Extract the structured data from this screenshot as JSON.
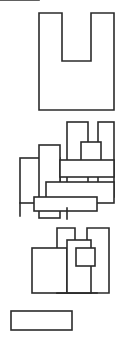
{
  "canvas": {
    "width": 135,
    "height": 339,
    "background_color": "#ffffff",
    "stroke_color": "#2b2b2b",
    "stroke_width": 1.6,
    "description": "Black-and-white line drawing of three grouped figures made of overlapping open rectangles"
  },
  "figures": [
    {
      "id": "top-figure",
      "name": "u-shape-with-base-divider",
      "parts": [
        {
          "name": "u-outline",
          "type": "polygon",
          "points": "39,13 62,13 62,61 91,61 91,13 114,13 114,110 39,110"
        },
        {
          "name": "base-divider-line",
          "type": "line",
          "x1": 39,
          "y1": 81,
          "x2": 114,
          "y2": 81
        }
      ]
    },
    {
      "id": "middle-figure",
      "name": "overlapping-rectangle-cluster",
      "parts": [
        {
          "name": "rect-a-tall-left",
          "type": "rect",
          "x": 39,
          "y": 145,
          "width": 21,
          "height": 73
        },
        {
          "name": "rect-b-low-left",
          "type": "rect",
          "x": 20,
          "y": 158,
          "width": 40,
          "height": 45
        },
        {
          "name": "rect-c-tall-center",
          "type": "rect",
          "x": 67,
          "y": 122,
          "width": 21,
          "height": 86
        },
        {
          "name": "rect-d-tall-right",
          "type": "rect",
          "x": 98,
          "y": 122,
          "width": 16,
          "height": 75
        },
        {
          "name": "rect-e-small-upper",
          "type": "rect",
          "x": 81,
          "y": 142,
          "width": 20,
          "height": 23
        },
        {
          "name": "rect-f-wide-mid",
          "type": "rect",
          "x": 60,
          "y": 160,
          "width": 54,
          "height": 17
        },
        {
          "name": "rect-g-wide-low",
          "type": "rect",
          "x": 46,
          "y": 182,
          "width": 68,
          "height": 21
        },
        {
          "name": "rect-h-baseline",
          "type": "rect",
          "x": 34,
          "y": 197,
          "width": 63,
          "height": 14
        },
        {
          "name": "tick-left-descender",
          "type": "line",
          "x1": 20,
          "y1": 203,
          "x2": 20,
          "y2": 216
        },
        {
          "name": "tick-center-descender",
          "type": "line",
          "x1": 67,
          "y1": 208,
          "x2": 67,
          "y2": 219
        }
      ]
    },
    {
      "id": "bottom-figure",
      "name": "u-shape-with-overlays-and-detached-rectangle",
      "parts": [
        {
          "name": "u-outline",
          "type": "polygon",
          "points": "57,228 75,228 75,283 87,283 87,228 109,228 109,293 57,293"
        },
        {
          "name": "rect-left-overlay",
          "type": "rect",
          "x": 32,
          "y": 248,
          "width": 35,
          "height": 45
        },
        {
          "name": "rect-center-overlay",
          "type": "rect",
          "x": 67,
          "y": 240,
          "width": 24,
          "height": 53
        },
        {
          "name": "rect-small-upper",
          "type": "rect",
          "x": 76,
          "y": 248,
          "width": 19,
          "height": 18
        },
        {
          "name": "baseline-thick",
          "type": "line",
          "x1": 57,
          "y1": 293,
          "x2": 97,
          "y2": 293
        },
        {
          "name": "detached-rectangle",
          "type": "rect",
          "x": 11,
          "y": 311,
          "width": 61,
          "height": 19
        }
      ]
    }
  ]
}
